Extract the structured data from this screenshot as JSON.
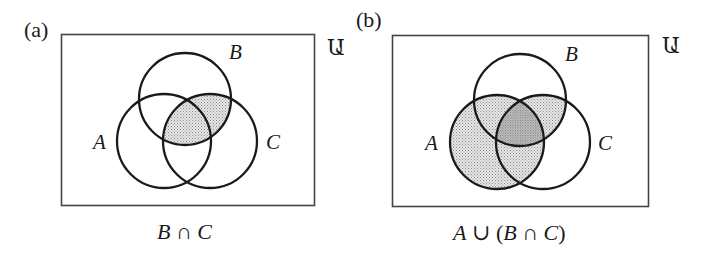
{
  "figure": {
    "panels": [
      {
        "tag": "(a)",
        "universe_label": "Ա",
        "set_labels": {
          "A": "A",
          "B": "B",
          "C": "C"
        },
        "caption_parts": [
          "B",
          " ∩ ",
          "C"
        ],
        "shaded_region": "B ∩ C",
        "fill_color": "#d4d4d4"
      },
      {
        "tag": "(b)",
        "universe_label": "Ա",
        "set_labels": {
          "A": "A",
          "B": "B",
          "C": "C"
        },
        "caption_parts": [
          "A",
          " ∪ (",
          "B",
          " ∩ ",
          "C",
          ")"
        ],
        "shaded_region": "A ∪ (B ∩ C)",
        "fill_color": "#d4d4d4",
        "overlap_color": "#b8b8b8"
      }
    ],
    "stroke_color": "#1a1a1a",
    "frame_color": "#444444"
  }
}
